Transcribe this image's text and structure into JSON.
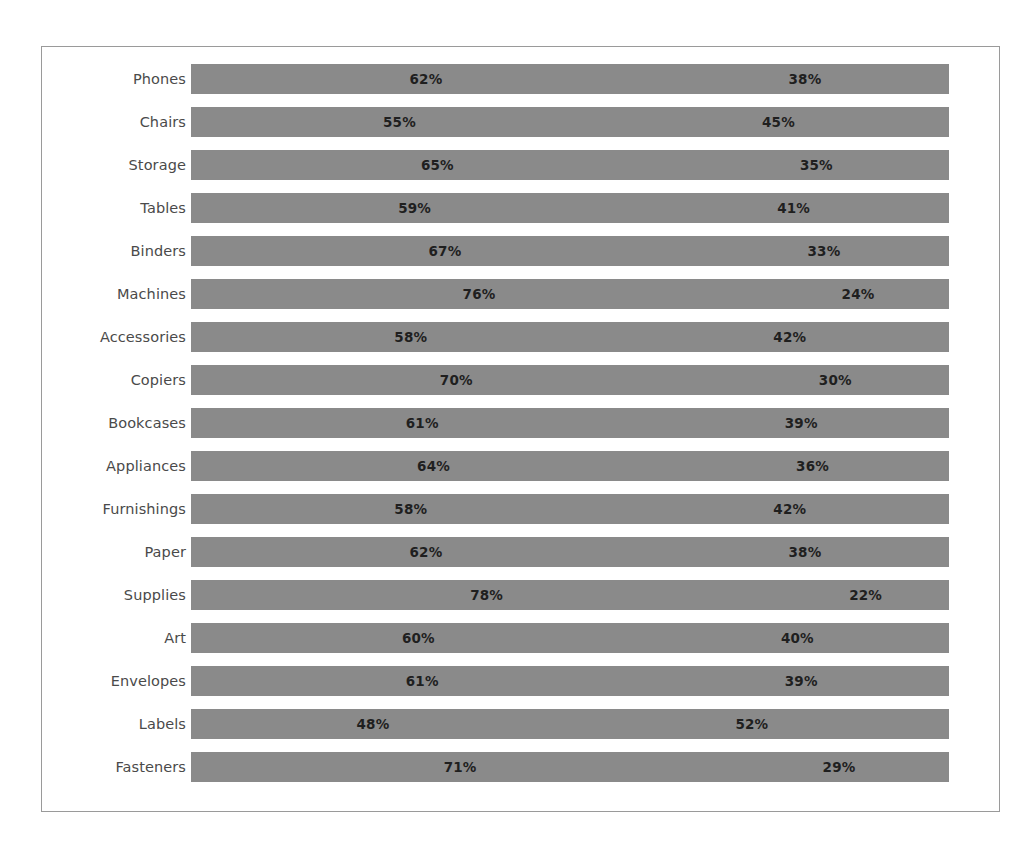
{
  "chart_data": {
    "type": "bar",
    "subtype": "100% stacked horizontal bar",
    "title": "",
    "subtitle": "",
    "xlabel": "",
    "ylabel": "",
    "xlim": [
      0,
      100
    ],
    "grid": false,
    "legend": "none",
    "value_suffix": "%",
    "bar_color": "#8a8a8a",
    "label_color": "#4a4a4a",
    "value_color": "#1f1f1f",
    "border_color": "#9a9a9a",
    "background": "#ffffff",
    "categories": [
      "Phones",
      "Chairs",
      "Storage",
      "Tables",
      "Binders",
      "Machines",
      "Accessories",
      "Copiers",
      "Bookcases",
      "Appliances",
      "Furnishings",
      "Paper",
      "Supplies",
      "Art",
      "Envelopes",
      "Labels",
      "Fasteners"
    ],
    "series": [
      {
        "name": "Segment 1",
        "values": [
          62,
          55,
          65,
          59,
          67,
          76,
          58,
          70,
          61,
          64,
          58,
          62,
          78,
          60,
          61,
          48,
          71
        ],
        "labels": [
          "62%",
          "55%",
          "65%",
          "59%",
          "67%",
          "76%",
          "58%",
          "70%",
          "61%",
          "64%",
          "58%",
          "62%",
          "78%",
          "60%",
          "61%",
          "48%",
          "71%"
        ]
      },
      {
        "name": "Segment 2",
        "values": [
          38,
          45,
          35,
          41,
          33,
          24,
          42,
          30,
          39,
          36,
          42,
          38,
          22,
          40,
          39,
          52,
          29
        ],
        "labels": [
          "38%",
          "45%",
          "35%",
          "41%",
          "33%",
          "24%",
          "42%",
          "30%",
          "39%",
          "36%",
          "42%",
          "38%",
          "22%",
          "40%",
          "39%",
          "52%",
          "29%"
        ]
      }
    ],
    "rows": [
      {
        "category": "Phones",
        "segments": [
          {
            "value": 62,
            "label": "62%"
          },
          {
            "value": 38,
            "label": "38%"
          }
        ]
      },
      {
        "category": "Chairs",
        "segments": [
          {
            "value": 55,
            "label": "55%"
          },
          {
            "value": 45,
            "label": "45%"
          }
        ]
      },
      {
        "category": "Storage",
        "segments": [
          {
            "value": 65,
            "label": "65%"
          },
          {
            "value": 35,
            "label": "35%"
          }
        ]
      },
      {
        "category": "Tables",
        "segments": [
          {
            "value": 59,
            "label": "59%"
          },
          {
            "value": 41,
            "label": "41%"
          }
        ]
      },
      {
        "category": "Binders",
        "segments": [
          {
            "value": 67,
            "label": "67%"
          },
          {
            "value": 33,
            "label": "33%"
          }
        ]
      },
      {
        "category": "Machines",
        "segments": [
          {
            "value": 76,
            "label": "76%"
          },
          {
            "value": 24,
            "label": "24%"
          }
        ]
      },
      {
        "category": "Accessories",
        "segments": [
          {
            "value": 58,
            "label": "58%"
          },
          {
            "value": 42,
            "label": "42%"
          }
        ]
      },
      {
        "category": "Copiers",
        "segments": [
          {
            "value": 70,
            "label": "70%"
          },
          {
            "value": 30,
            "label": "30%"
          }
        ]
      },
      {
        "category": "Bookcases",
        "segments": [
          {
            "value": 61,
            "label": "61%"
          },
          {
            "value": 39,
            "label": "39%"
          }
        ]
      },
      {
        "category": "Appliances",
        "segments": [
          {
            "value": 64,
            "label": "64%"
          },
          {
            "value": 36,
            "label": "36%"
          }
        ]
      },
      {
        "category": "Furnishings",
        "segments": [
          {
            "value": 58,
            "label": "58%"
          },
          {
            "value": 42,
            "label": "42%"
          }
        ]
      },
      {
        "category": "Paper",
        "segments": [
          {
            "value": 62,
            "label": "62%"
          },
          {
            "value": 38,
            "label": "38%"
          }
        ]
      },
      {
        "category": "Supplies",
        "segments": [
          {
            "value": 78,
            "label": "78%"
          },
          {
            "value": 22,
            "label": "22%"
          }
        ]
      },
      {
        "category": "Art",
        "segments": [
          {
            "value": 60,
            "label": "60%"
          },
          {
            "value": 40,
            "label": "40%"
          }
        ]
      },
      {
        "category": "Envelopes",
        "segments": [
          {
            "value": 61,
            "label": "61%"
          },
          {
            "value": 39,
            "label": "39%"
          }
        ]
      },
      {
        "category": "Labels",
        "segments": [
          {
            "value": 48,
            "label": "48%"
          },
          {
            "value": 52,
            "label": "52%"
          }
        ]
      },
      {
        "category": "Fasteners",
        "segments": [
          {
            "value": 71,
            "label": "71%"
          },
          {
            "value": 29,
            "label": "29%"
          }
        ]
      }
    ]
  }
}
